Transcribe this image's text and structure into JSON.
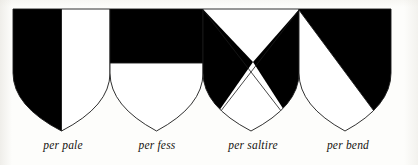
{
  "plate": {
    "title": "Field divisions of the shield",
    "background_color": "#fdfdfb",
    "tincture_dark": "#000000",
    "tincture_light": "#ffffff",
    "outline_color": "#1a1a1a",
    "shield_top_y": 9,
    "shield_tip_y": 131,
    "caption_baseline_y": 150
  },
  "shields": [
    {
      "id": "per-pale",
      "label": "per pale",
      "division": "per pale",
      "description": "Vertical line of division; dexter half sable, sinister half argent.",
      "left": 13,
      "right": 110,
      "center_x": 61.5,
      "top": 9,
      "tip_y": 131,
      "tinctures": [
        "sable",
        "argent"
      ],
      "fills": [
        "#000000",
        "#ffffff"
      ],
      "caption_center_x": 63,
      "caption_y": 139
    },
    {
      "id": "per-fess",
      "label": "per fess",
      "division": "per fess",
      "description": "Horizontal line of division; chief sable, base argent.",
      "left": 110,
      "right": 203,
      "center_x": 156.5,
      "top": 9,
      "tip_y": 131,
      "fess_line_y": 63,
      "tinctures": [
        "sable",
        "argent"
      ],
      "fills": [
        "#000000",
        "#ffffff"
      ],
      "caption_center_x": 157,
      "caption_y": 139
    },
    {
      "id": "per-saltire",
      "label": "per saltire",
      "division": "per saltire",
      "description": "Two diagonal lines crossing; chief and base argent, flanks sable.",
      "left": 203,
      "right": 299,
      "center_x": 251,
      "top": 9,
      "tip_y": 131,
      "cross_point_x": 253,
      "cross_point_y": 62,
      "tinctures": [
        "argent",
        "sable",
        "sable",
        "argent"
      ],
      "fills": [
        "#ffffff",
        "#000000",
        "#000000",
        "#ffffff"
      ],
      "caption_center_x": 253,
      "caption_y": 139
    },
    {
      "id": "per-bend",
      "label": "per bend",
      "division": "per bend",
      "description": "Diagonal line from dexter chief to sinister base; upper sable, lower argent.",
      "left": 299,
      "right": 391,
      "center_x": 345,
      "top": 9,
      "tip_y": 131,
      "tinctures": [
        "sable",
        "argent"
      ],
      "fills": [
        "#000000",
        "#ffffff"
      ],
      "caption_center_x": 348,
      "caption_y": 139
    }
  ]
}
